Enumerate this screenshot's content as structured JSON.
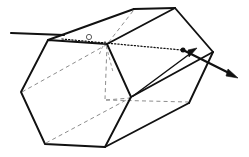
{
  "figure": {
    "caption": "",
    "background_color": "#ffffff",
    "line_color": "#111111",
    "hidden_line_color": "#8d8d8d",
    "width": 249,
    "height": 157
  },
  "labels": {
    "incident_ray": "",
    "internal_ray": "",
    "exit_ray": "",
    "normal": "",
    "entry_point": "",
    "exit_point": ""
  },
  "geometry": {
    "front_hexagon": {
      "name": "front-hexagonal-face",
      "points": "48,40 21,92 45,144 105,147 131,97 107,44"
    },
    "back_hexagon": {
      "name": "back-hexagonal-face",
      "points": "134,9 107,44 131,97 189,103 213,52 175,8"
    },
    "connector_edges": [
      {
        "name": "edge-top-left",
        "from": "48,40",
        "to": "134,9"
      },
      {
        "name": "edge-top-right",
        "from": "107,44",
        "to": "175,8"
      },
      {
        "name": "edge-mid-right",
        "from": "131,97",
        "to": "213,52"
      },
      {
        "name": "edge-bottom-right",
        "from": "105,147",
        "to": "189,103"
      }
    ],
    "hidden_edges": [
      {
        "name": "hidden-edge-left-diagonal",
        "from": "21,92",
        "to": "107,44"
      },
      {
        "name": "hidden-edge-lower-diagonal",
        "from": "45,144",
        "to": "131,97"
      },
      {
        "name": "hidden-edge-vertical-interior",
        "from": "107,44",
        "to": "105,100"
      },
      {
        "name": "hidden-edge-interior-right",
        "from": "105,100",
        "to": "189,103"
      },
      {
        "name": "hidden-edge-back-diag",
        "from": "134,9",
        "to": "107,44"
      },
      {
        "name": "hidden-edge-back-lower",
        "from": "105,100",
        "to": "131,97"
      }
    ]
  },
  "rays": {
    "incident": {
      "name": "incident-ray",
      "from": "11,33",
      "to": "64,35",
      "description": "horizontal incoming light ray"
    },
    "internal": {
      "name": "internal-ray-dotted",
      "from": "63,39",
      "to": "183,50",
      "description": "dotted refracted ray inside the prism"
    },
    "exit": {
      "name": "exit-ray-arrow",
      "from": "183,50",
      "to": "236,77",
      "description": "refracted ray exiting toward lower right with arrowhead"
    },
    "secondary": {
      "name": "secondary-ray",
      "from": "132,95",
      "to": "190,51",
      "description": "thin line from lower interior toward upper right arrowhead"
    },
    "normal": {
      "name": "surface-normal",
      "from": "105,41",
      "to": "113,72",
      "description": "dashed normal line at the entry face"
    },
    "entry_marker": {
      "name": "entry-point-circle",
      "cx": 89,
      "cy": 37,
      "r": 2.6
    },
    "exit_marker": {
      "name": "exit-point-dot",
      "cx": 183,
      "cy": 50,
      "r": 2.4
    }
  }
}
